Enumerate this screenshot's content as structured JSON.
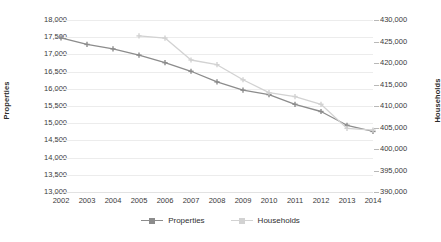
{
  "chart_data": {
    "type": "line",
    "title": "",
    "xlabel": "",
    "ylabel": "Properties",
    "y2label": "Households",
    "categories": [
      2002,
      2003,
      2004,
      2005,
      2006,
      2007,
      2008,
      2009,
      2010,
      2011,
      2012,
      2013,
      2014
    ],
    "x_tick_labels": [
      "2002",
      "2003",
      "2004",
      "2005",
      "2006",
      "2007",
      "2008",
      "2009",
      "2010",
      "2011",
      "2012",
      "2013",
      "2014"
    ],
    "ylim": [
      13000,
      18000
    ],
    "y_tick_step": 500,
    "y_tick_labels": [
      "18,000",
      "17,500",
      "17,000",
      "16,500",
      "16,000",
      "15,500",
      "15,000",
      "14,500",
      "14,000",
      "13,500",
      "13,000"
    ],
    "y2lim": [
      390000,
      430000
    ],
    "y2_tick_step": 5000,
    "y2_tick_labels": [
      "430,000",
      "425,000",
      "420,000",
      "415,000",
      "410,000",
      "405,000",
      "400,000",
      "395,000",
      "390,000"
    ],
    "grid": true,
    "grid_axis": "y",
    "legend_position": "bottom",
    "series": [
      {
        "name": "Properties",
        "axis": "left",
        "color": "#8c8c8c",
        "marker": "plus",
        "x": [
          2002,
          2003,
          2004,
          2005,
          2006,
          2007,
          2008,
          2009,
          2010,
          2011,
          2012,
          2013,
          2014
        ],
        "values": [
          17480,
          17290,
          17160,
          16980,
          16760,
          16510,
          16200,
          15960,
          15830,
          15550,
          15340,
          14940,
          14760
        ]
      },
      {
        "name": "Households",
        "axis": "right",
        "color": "#d2d2d2",
        "marker": "plus",
        "x": [
          2005,
          2006,
          2007,
          2008,
          2009,
          2010,
          2011,
          2012,
          2013,
          2014
        ],
        "values": [
          426300,
          425800,
          420700,
          419600,
          416100,
          413100,
          412200,
          410400,
          404800,
          404400
        ]
      }
    ]
  },
  "legend": {
    "items": [
      {
        "label": "Properties"
      },
      {
        "label": "Households"
      }
    ]
  }
}
